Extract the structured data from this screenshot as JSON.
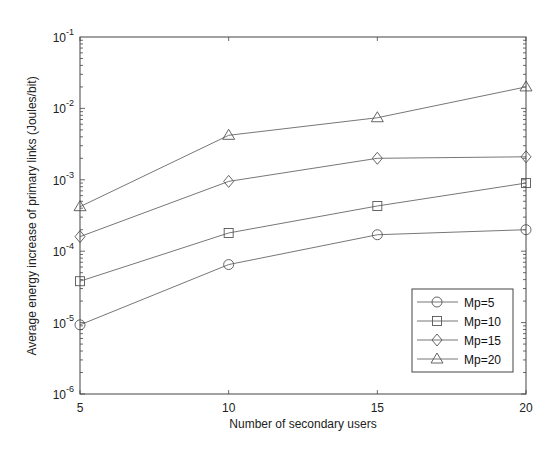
{
  "chart_data": {
    "type": "line",
    "title": "",
    "xlabel": "Number of secondary users",
    "ylabel": "Average energy increase of primary links (Joules/bit)",
    "x": [
      5,
      10,
      15,
      20
    ],
    "xlim": [
      5,
      20
    ],
    "xticks": [
      5,
      10,
      15,
      20
    ],
    "xtick_labels": [
      "5",
      "10",
      "15",
      "20"
    ],
    "yscale": "log",
    "ylim": [
      1e-06,
      0.1
    ],
    "yticks": [
      1e-06,
      1e-05,
      0.0001,
      0.001,
      0.01,
      0.1
    ],
    "ytick_labels": [
      {
        "base": "10",
        "exp": "-6"
      },
      {
        "base": "10",
        "exp": "-5"
      },
      {
        "base": "10",
        "exp": "-4"
      },
      {
        "base": "10",
        "exp": "-3"
      },
      {
        "base": "10",
        "exp": "-2"
      },
      {
        "base": "10",
        "exp": "-1"
      }
    ],
    "grid": false,
    "legend_position": "lower right",
    "series": [
      {
        "name": "Mp=5",
        "marker": "circle",
        "values": [
          9.3e-06,
          6.5e-05,
          0.00017,
          0.0002
        ]
      },
      {
        "name": "Mp=10",
        "marker": "square",
        "values": [
          3.8e-05,
          0.00018,
          0.00043,
          0.0009
        ]
      },
      {
        "name": "Mp=15",
        "marker": "diamond",
        "values": [
          0.00016,
          0.00095,
          0.002,
          0.0021
        ]
      },
      {
        "name": "Mp=20",
        "marker": "triangle",
        "values": [
          0.00042,
          0.0042,
          0.0074,
          0.02
        ]
      }
    ]
  },
  "colors": {
    "line": "#777777",
    "marker": "#555555",
    "frame": "#444444",
    "text": "#222222"
  }
}
